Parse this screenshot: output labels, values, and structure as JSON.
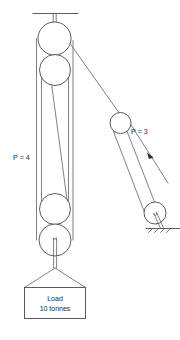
{
  "figure": {
    "type": "pulley-system-diagram",
    "background_color": "#ffffff",
    "line_color": "#4a4a4a",
    "text_color": "#2b2b2b"
  },
  "labels": {
    "left_block": "P = 4",
    "right_block": "P = 3"
  },
  "load": {
    "title": "Load",
    "weight": "10 tonnes"
  },
  "components": {
    "ceiling_support": "ceiling-beam",
    "left_block_pulley_count": 4,
    "right_block_pulley_count": 2,
    "ground_anchor": "ground-hatching",
    "rope_direction_arrow": "pull-direction-arrow"
  }
}
